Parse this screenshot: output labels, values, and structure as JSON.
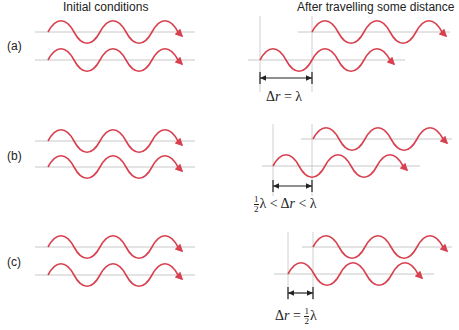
{
  "headers": {
    "left": "Initial conditions",
    "right": "After travelling some distance"
  },
  "rows": [
    {
      "label": "(a)",
      "equation": {
        "prefix": "",
        "delta": "Δ",
        "r": "r",
        "rel": " = λ",
        "suffix": ""
      },
      "path_difference": "Δr = λ"
    },
    {
      "label": "(b)",
      "equation": {
        "half_num": "1",
        "half_den": "2",
        "lead": "λ < ",
        "delta": "Δ",
        "r": "r",
        "tail": " < λ"
      },
      "path_difference": "½λ < Δr < λ"
    },
    {
      "label": "(c)",
      "equation": {
        "delta": "Δ",
        "r": "r",
        "rel": " = ",
        "half_num": "1",
        "half_den": "2",
        "tail": "λ"
      },
      "path_difference": "Δr = ½λ"
    }
  ],
  "colors": {
    "wave": "#d9404f",
    "axis": "#c8c8c8",
    "marker": "#222222"
  }
}
